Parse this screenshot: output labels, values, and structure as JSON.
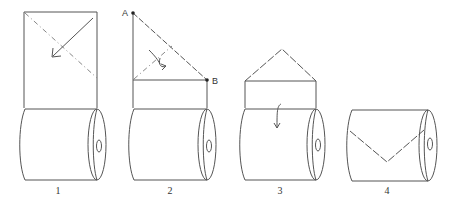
{
  "diagram": {
    "steps": [
      {
        "number": "1",
        "description": "Fold corner diagonally"
      },
      {
        "number": "2",
        "description": "Fold triangle from A to B"
      },
      {
        "number": "3",
        "description": "Fold down over roll"
      },
      {
        "number": "4",
        "description": "Finished V fold"
      }
    ],
    "points": {
      "a": "A",
      "b": "B"
    },
    "colors": {
      "line": "#555555",
      "dash": "#888888",
      "background": "#ffffff"
    }
  }
}
